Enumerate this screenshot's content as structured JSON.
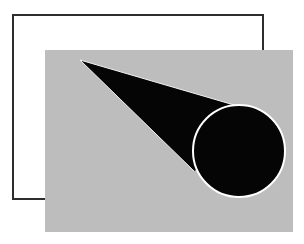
{
  "figure": {
    "colors": {
      "background": "#ffffff",
      "outline_rect_stroke": "#2e2e2e",
      "gray_rect_fill": "#bdbdbd",
      "cone_fill": "#050505",
      "circle_fill": "#050505",
      "circle_stroke": "#ffffff"
    },
    "outline_rect": {
      "x": 13,
      "y": 15,
      "width": 250,
      "height": 184,
      "stroke_width": 2
    },
    "gray_rect": {
      "x": 45,
      "y": 50,
      "width": 248,
      "height": 182
    },
    "cone": {
      "apex": [
        80,
        60
      ],
      "tangent_upper": [
        241,
        107
      ],
      "tangent_lower": [
        194,
        171
      ]
    },
    "circle": {
      "cx": 239,
      "cy": 151,
      "r": 46,
      "stroke_width": 2
    }
  }
}
